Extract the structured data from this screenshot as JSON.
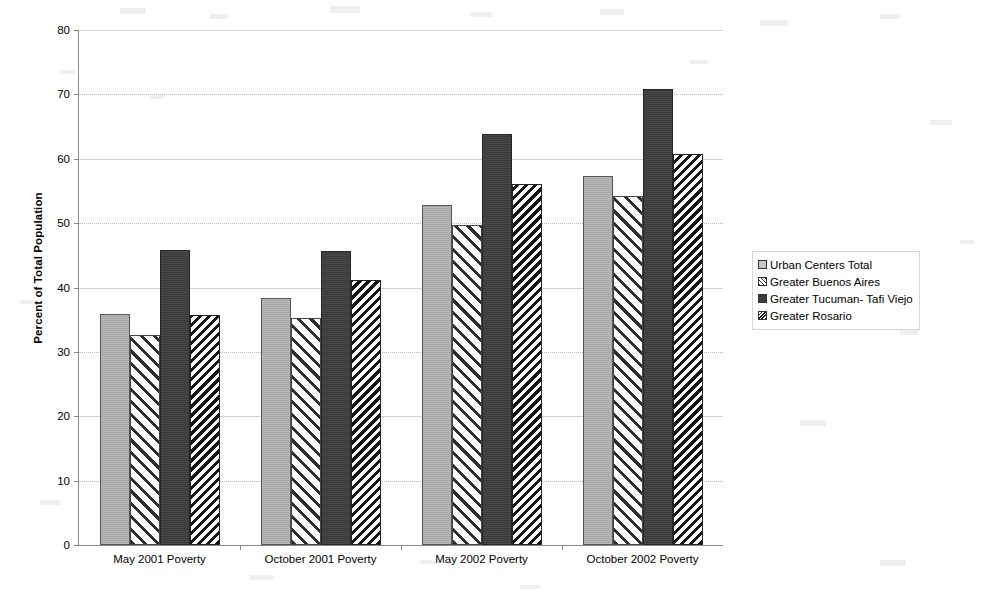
{
  "chart_data": {
    "type": "bar",
    "title": "",
    "xlabel": "",
    "ylabel": "Percent of Total Population",
    "ylim": [
      0,
      80
    ],
    "yticks": [
      0,
      10,
      20,
      30,
      40,
      50,
      60,
      70,
      80
    ],
    "grid": true,
    "legend_position": "right",
    "categories": [
      "May 2001 Poverty",
      "October 2001 Poverty",
      "May 2002 Poverty",
      "October 2002 Poverty"
    ],
    "series": [
      {
        "name": "Urban Centers Total",
        "values": [
          35.9,
          38.3,
          52.8,
          57.4
        ]
      },
      {
        "name": "Greater Buenos Aires",
        "values": [
          32.7,
          35.2,
          49.7,
          54.2
        ]
      },
      {
        "name": "Greater Tucuman- Tafi Viejo",
        "values": [
          45.8,
          45.7,
          63.8,
          70.8
        ]
      },
      {
        "name": "Greater Rosario",
        "values": [
          35.8,
          41.2,
          56.1,
          60.8
        ]
      }
    ]
  },
  "axes": {
    "y_title": "Percent of Total Population",
    "y_tick_labels": [
      "0",
      "10",
      "20",
      "30",
      "40",
      "50",
      "60",
      "70",
      "80"
    ],
    "x_tick_labels": [
      "May 2001 Poverty",
      "October 2001 Poverty",
      "May 2002 Poverty",
      "October 2002 Poverty"
    ]
  },
  "legend": {
    "items": [
      {
        "label": "Urban Centers Total",
        "swatch": "light-gray-solid-swatch"
      },
      {
        "label": "Greater Buenos Aires",
        "swatch": "light-diagonal-hatch-swatch"
      },
      {
        "label": "Greater Tucuman- Tafi Viejo",
        "swatch": "dark-gray-solid-swatch"
      },
      {
        "label": "Greater Rosario",
        "swatch": "dense-diagonal-hatch-swatch"
      }
    ]
  },
  "colors": {
    "series_1": "#a9a9a9",
    "series_2": "#ffffff",
    "series_3": "#3a3a3a",
    "series_4": "#151515",
    "gridline": "#b9b9b9",
    "axis": "#8a8a8a",
    "background": "#ffffff"
  }
}
